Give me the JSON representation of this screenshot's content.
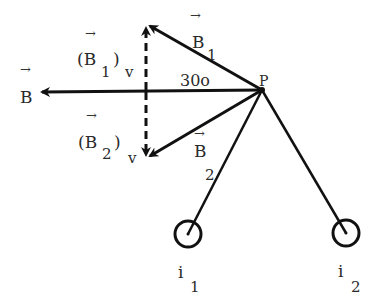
{
  "diagram": {
    "type": "vector-diagram",
    "colors": {
      "background": "#ffffff",
      "ink": "#111111"
    },
    "point": {
      "label": "P",
      "x": 262,
      "y": 90
    },
    "angle_label": "30o",
    "vectors": {
      "B1": {
        "symbol": "B",
        "subscript": "1",
        "arrow": "→",
        "from": [
          262,
          90
        ],
        "to": [
          147,
          24
        ]
      },
      "B": {
        "symbol": "B",
        "subscript": "",
        "arrow": "→",
        "from": [
          262,
          90
        ],
        "to": [
          40,
          92
        ]
      },
      "B2": {
        "symbol": "B",
        "subscript": "2",
        "arrow": "→",
        "from": [
          262,
          90
        ],
        "to": [
          147,
          158
        ]
      }
    },
    "components": {
      "B1v": {
        "text": "(B",
        "subscript": "1",
        "close": ")",
        "suffix": "v",
        "arrow": "→"
      },
      "B2v": {
        "text": "(B",
        "subscript": "2",
        "close": ")",
        "suffix": "v",
        "arrow": "→"
      }
    },
    "currents": [
      {
        "label": "i",
        "subscript": "1",
        "cx": 188,
        "cy": 234,
        "r": 11
      },
      {
        "label": "i",
        "subscript": "2",
        "cx": 346,
        "cy": 233,
        "r": 11
      }
    ]
  }
}
